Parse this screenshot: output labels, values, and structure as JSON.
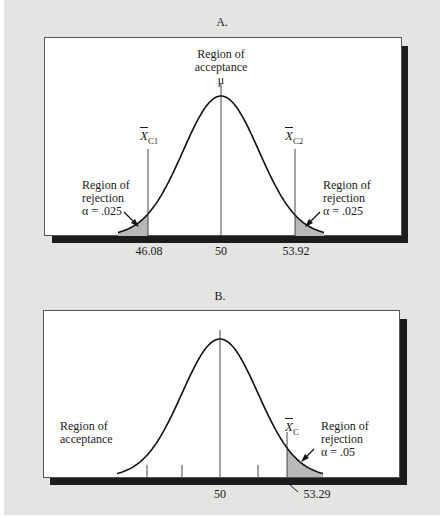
{
  "chart_data": [
    {
      "type": "area",
      "title": "A.",
      "subtitle": "Two-tailed test",
      "distribution": "normal",
      "mean": 50,
      "x_tick_labels": [
        "46.08",
        "50",
        "53.92"
      ],
      "critical_values": [
        46.08,
        53.92
      ],
      "critical_labels": [
        "X̄C1",
        "X̄C2"
      ],
      "center_label": "μ",
      "annotations": [
        {
          "text": "Region of acceptance",
          "position": "top-center"
        },
        {
          "text": "Region of rejection α = .025",
          "position": "left-tail"
        },
        {
          "text": "Region of rejection α = .025",
          "position": "right-tail"
        }
      ],
      "alpha_per_tail": 0.025,
      "shaded_regions": [
        [
          null,
          46.08
        ],
        [
          53.92,
          null
        ]
      ],
      "grid": false
    },
    {
      "type": "area",
      "title": "B.",
      "subtitle": "One-tailed test",
      "distribution": "normal",
      "mean": 50,
      "x_tick_labels": [
        "50",
        "53.29"
      ],
      "critical_values": [
        53.29
      ],
      "critical_labels": [
        "X̄C"
      ],
      "annotations": [
        {
          "text": "Region of acceptance",
          "position": "left"
        },
        {
          "text": "Region of rejection α = .05",
          "position": "right-tail"
        }
      ],
      "alpha": 0.05,
      "shaded_regions": [
        [
          53.29,
          null
        ]
      ],
      "minor_ticks": 4,
      "grid": false
    }
  ],
  "panelA": {
    "title": "A.",
    "acceptance_line1": "Region of",
    "acceptance_line2": "acceptance",
    "mu": "μ",
    "crit1_label": "X",
    "crit1_sub": "C",
    "crit1_subsub": "1",
    "crit2_label": "X",
    "crit2_sub": "C",
    "crit2_subsub": "2",
    "left_rej_line1": "Region of",
    "left_rej_line2": "rejection",
    "left_rej_line3": "α = .025",
    "right_rej_line1": "Region of",
    "right_rej_line2": "rejection",
    "right_rej_line3": "α = .025",
    "tick_left": "46.08",
    "tick_center": "50",
    "tick_right": "53.92"
  },
  "panelB": {
    "title": "B.",
    "acceptance_line1": "Region of",
    "acceptance_line2": "acceptance",
    "crit_label": "X",
    "crit_sub": "C",
    "rej_line1": "Region of",
    "rej_line2": "rejection",
    "rej_line3": "α = .05",
    "tick_center": "50",
    "tick_crit": "53.29"
  },
  "colors": {
    "background": "#e4e4e2",
    "panel": "#ffffff",
    "shadow": "#1c1c1c",
    "curve": "#111111",
    "shade": "#b8b8b8"
  }
}
